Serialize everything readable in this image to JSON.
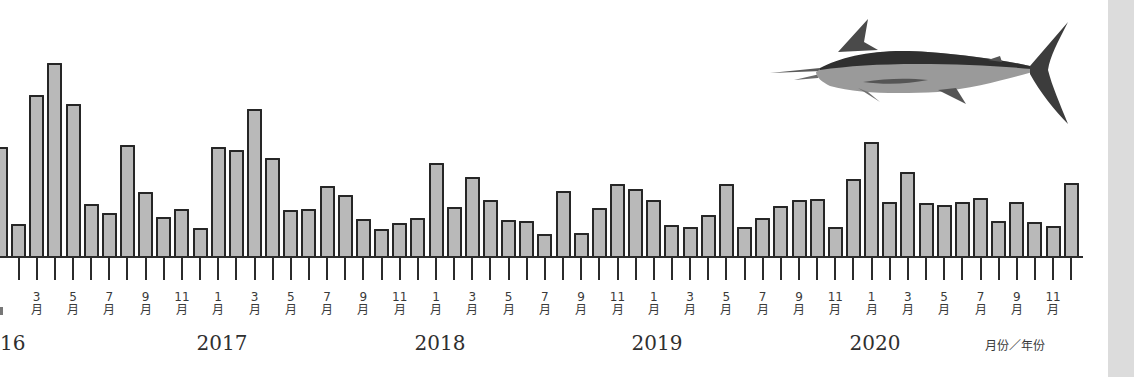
{
  "chart_data": {
    "type": "bar",
    "title": "",
    "xlabel": "月份／年份",
    "ylabel": "",
    "grid": false,
    "legend": null,
    "years": [
      "2016",
      "2017",
      "2018",
      "2019",
      "2020"
    ],
    "year_labels_visible": [
      "16",
      "2017",
      "2018",
      "2019",
      "2020"
    ],
    "month_tick_labels": [
      "3月",
      "5月",
      "7月",
      "9月",
      "11月",
      "1月",
      "3月",
      "5月",
      "7月",
      "9月",
      "11月",
      "1月",
      "3月",
      "5月",
      "7月",
      "9月",
      "11月",
      "1月",
      "3月",
      "5月",
      "7月",
      "9月",
      "11月",
      "1月",
      "3月",
      "5月",
      "7月",
      "9月",
      "11月"
    ],
    "categories": [
      "2016-01",
      "2016-02",
      "2016-03",
      "2016-04",
      "2016-05",
      "2016-06",
      "2016-07",
      "2016-08",
      "2016-09",
      "2016-10",
      "2016-11",
      "2016-12",
      "2017-01",
      "2017-02",
      "2017-03",
      "2017-04",
      "2017-05",
      "2017-06",
      "2017-07",
      "2017-08",
      "2017-09",
      "2017-10",
      "2017-11",
      "2017-12",
      "2018-01",
      "2018-02",
      "2018-03",
      "2018-04",
      "2018-05",
      "2018-06",
      "2018-07",
      "2018-08",
      "2018-09",
      "2018-10",
      "2018-11",
      "2018-12",
      "2019-01",
      "2019-02",
      "2019-03",
      "2019-04",
      "2019-05",
      "2019-06",
      "2019-07",
      "2019-08",
      "2019-09",
      "2019-10",
      "2019-11",
      "2019-12",
      "2020-01",
      "2020-02",
      "2020-03",
      "2020-04",
      "2020-05",
      "2020-06",
      "2020-07",
      "2020-08",
      "2020-09",
      "2020-10",
      "2020-11",
      "2020-12"
    ],
    "values": [
      109,
      32,
      161,
      193,
      152,
      52,
      43,
      111,
      64,
      39,
      47,
      28,
      109,
      106,
      147,
      98,
      46,
      47,
      70,
      61,
      37,
      27,
      33,
      38,
      93,
      49,
      79,
      56,
      36,
      35,
      22,
      65,
      23,
      48,
      72,
      67,
      56,
      31,
      29,
      41,
      72,
      29,
      38,
      50,
      56,
      57,
      29,
      77,
      114,
      54,
      84,
      53,
      51,
      54,
      58,
      35,
      54,
      34,
      30,
      73
    ],
    "value_unit": "relative bar height (no y-axis shown)",
    "ylim": [
      0,
      200
    ],
    "colors": {
      "bar_fill": "#b9b9b9",
      "bar_edge": "#262626",
      "axis": "#2b2b2b"
    }
  },
  "illustration": {
    "name": "marlin-fish",
    "description": "Blue marlin illustration, top right"
  },
  "axis_unit_label": "月份／年份"
}
